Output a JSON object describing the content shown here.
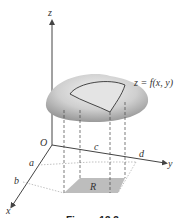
{
  "figure": {
    "labels": {
      "z_axis": "z",
      "y_axis": "y",
      "x_axis": "x",
      "origin": "O",
      "a": "a",
      "b": "b",
      "c": "c",
      "d": "d",
      "region": "R",
      "surface": "z = f(x, y)"
    },
    "caption": "Figure 13.3",
    "colors": {
      "surface": "#c8c8c8",
      "region": "#bdbdbd",
      "axis": "#444444"
    }
  }
}
